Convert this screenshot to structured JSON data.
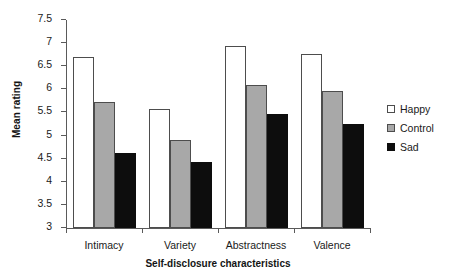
{
  "chart_data": {
    "type": "bar",
    "title": "",
    "xlabel": "Self-disclosure characteristics",
    "ylabel": "Mean rating",
    "categories": [
      "Intimacy",
      "Variety",
      "Abstractness",
      "Valence"
    ],
    "series": [
      {
        "name": "Happy",
        "color": "#ffffff",
        "values": [
          6.69,
          5.57,
          6.93,
          6.76
        ]
      },
      {
        "name": "Control",
        "color": "#a8a8a8",
        "values": [
          5.72,
          4.9,
          6.1,
          5.97
        ]
      },
      {
        "name": "Sad",
        "color": "#0d0d0d",
        "values": [
          4.63,
          4.43,
          5.46,
          5.26
        ]
      }
    ],
    "ylim": [
      3,
      7.5
    ],
    "ytick_labels": [
      "7.5",
      "7",
      "6.5",
      "6",
      "5.5",
      "5",
      "4.5",
      "4",
      "3.5",
      "3"
    ],
    "ytick_values": [
      7.5,
      7,
      6.5,
      6,
      5.5,
      5,
      4.5,
      4,
      3.5,
      3
    ],
    "grid": false,
    "legend_position": "right",
    "legend_entries": [
      "Happy",
      "Control",
      "Sad"
    ],
    "bar_border_color": "#4d4d4d",
    "axis_color": "#5a5a5a"
  }
}
